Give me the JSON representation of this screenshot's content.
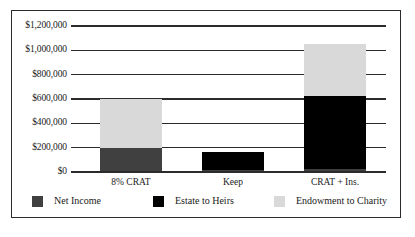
{
  "chart_data": {
    "type": "bar",
    "subtype": "stacked",
    "title": "",
    "xlabel": "",
    "ylabel": "",
    "categories": [
      "8% CRAT",
      "Keep",
      "CRAT + Ins."
    ],
    "series": [
      {
        "name": "Net Income",
        "color": "#404040",
        "values": [
          200000,
          15000,
          25000
        ]
      },
      {
        "name": "Estate to Heirs",
        "color": "#000000",
        "values": [
          0,
          150000,
          600000
        ]
      },
      {
        "name": "Endowment to Charity",
        "color": "#d9d9d9",
        "values": [
          400000,
          0,
          425000
        ]
      }
    ],
    "totals": [
      600000,
      165000,
      1050000
    ],
    "ylim": [
      0,
      1200000
    ],
    "ytick_values": [
      0,
      200000,
      400000,
      600000,
      800000,
      1000000,
      1200000
    ],
    "ytick_labels": [
      "$0",
      "$200,000",
      "$400,000",
      "$600,000",
      "$800,000",
      "$1,000,000",
      "$1,200,000"
    ],
    "grid": true,
    "legend_position": "bottom"
  },
  "legend": {
    "items": [
      {
        "label": "Net Income",
        "color": "#404040"
      },
      {
        "label": "Estate to Heirs",
        "color": "#000000"
      },
      {
        "label": "Endowment to Charity",
        "color": "#d9d9d9"
      }
    ]
  },
  "colors": {
    "frame": "#2b2b2b",
    "axis": "#2b2b2b",
    "background": "#ffffff",
    "text": "#1a1a1a"
  }
}
